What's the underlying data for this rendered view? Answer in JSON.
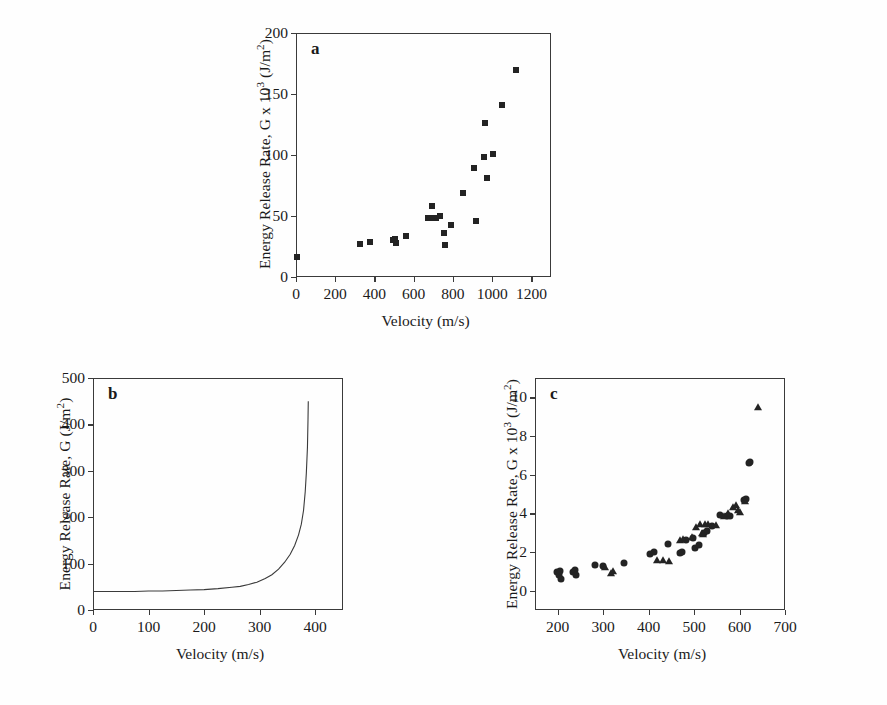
{
  "figure": {
    "background": "#fefefe",
    "ink": "#232323"
  },
  "panels": {
    "a": {
      "letter": "a",
      "xlabel": "Velocity (m/s)",
      "ylabel_parts": {
        "pre": "Energy Release Rate, G x 10",
        "sup": "3",
        "post": " (J/m",
        "sup2": "2",
        "post2": ")"
      },
      "ylabel_text": "Energy Release Rate, G x 10³ (J/m²)"
    },
    "b": {
      "letter": "b",
      "xlabel": "Velocity (m/s)",
      "ylabel_text": "Energy Release Rate, G (J/m²)"
    },
    "c": {
      "letter": "c",
      "xlabel": "Velocity (m/s)",
      "ylabel_text": "Energy Release Rate, G x 10³ (J/m²)"
    }
  },
  "chart_data": [
    {
      "id": "a",
      "type": "scatter",
      "title": "a",
      "xlabel": "Velocity (m/s)",
      "ylabel": "Energy Release Rate, G x 10³ (J/m²)",
      "xlim": [
        0,
        1300
      ],
      "ylim": [
        0,
        200
      ],
      "xticks": [
        0,
        200,
        400,
        600,
        800,
        1000,
        1200
      ],
      "xtick_labels": [
        "0",
        "200",
        "400",
        "600",
        "800",
        "1000",
        "1200"
      ],
      "yticks": [
        0,
        50,
        100,
        150,
        200
      ],
      "ytick_labels": [
        "0",
        "50",
        "100",
        "150",
        "200"
      ],
      "grid": false,
      "legend": "none",
      "series": [
        {
          "name": "Energy release rate",
          "marker": "square",
          "points": [
            [
              5,
              16
            ],
            [
              325,
              27
            ],
            [
              378,
              29
            ],
            [
              495,
              30
            ],
            [
              503,
              31
            ],
            [
              508,
              28
            ],
            [
              560,
              34
            ],
            [
              672,
              48
            ],
            [
              693,
              58
            ],
            [
              700,
              48
            ],
            [
              712,
              48
            ],
            [
              733,
              50
            ],
            [
              757,
              36
            ],
            [
              760,
              26
            ],
            [
              790,
              43
            ],
            [
              852,
              69
            ],
            [
              905,
              89
            ],
            [
              918,
              46
            ],
            [
              958,
              98
            ],
            [
              965,
              126
            ],
            [
              972,
              81
            ],
            [
              1002,
              101
            ],
            [
              1050,
              141
            ],
            [
              1122,
              170
            ]
          ]
        }
      ]
    },
    {
      "id": "b",
      "type": "line",
      "title": "b",
      "xlabel": "Velocity (m/s)",
      "ylabel": "Energy Release Rate, G (J/m²)",
      "xlim": [
        0,
        450
      ],
      "ylim": [
        0,
        500
      ],
      "xticks": [
        0,
        100,
        200,
        300,
        400
      ],
      "xtick_labels": [
        "0",
        "100",
        "200",
        "300",
        "400"
      ],
      "yticks": [
        0,
        100,
        200,
        300,
        400,
        500
      ],
      "ytick_labels": [
        "0",
        "100",
        "200",
        "300",
        "400",
        "500"
      ],
      "grid": false,
      "legend": "none",
      "series": [
        {
          "name": "G(v) asymptotic curve",
          "asymptote_velocity": 387,
          "baseline_G": 40,
          "x": [
            0,
            25,
            50,
            75,
            100,
            125,
            150,
            175,
            200,
            225,
            250,
            265,
            280,
            295,
            310,
            322,
            334,
            345,
            355,
            363,
            370,
            375,
            379,
            382,
            384,
            386,
            387,
            387.5
          ],
          "y": [
            40,
            40,
            40,
            40,
            41,
            41,
            42,
            43,
            44,
            46,
            49,
            51,
            55,
            60,
            68,
            76,
            88,
            103,
            120,
            139,
            162,
            185,
            215,
            255,
            295,
            350,
            410,
            450
          ]
        }
      ]
    },
    {
      "id": "c",
      "type": "scatter",
      "title": "c",
      "xlabel": "Velocity (m/s)",
      "ylabel": "Energy Release Rate, G x 10³ (J/m²)",
      "xlim": [
        150,
        700
      ],
      "ylim": [
        -1,
        11
      ],
      "xticks": [
        200,
        300,
        400,
        500,
        600,
        700
      ],
      "xtick_labels": [
        "200",
        "300",
        "400",
        "500",
        "600",
        "700"
      ],
      "yticks": [
        0,
        2,
        4,
        6,
        8,
        10
      ],
      "ytick_labels": [
        "0",
        "2",
        "4",
        "6",
        "8",
        "10"
      ],
      "grid": false,
      "legend": "none",
      "series": [
        {
          "name": "Circles",
          "marker": "circle",
          "points": [
            [
              198,
              0.95
            ],
            [
              203,
              0.8
            ],
            [
              206,
              1.0
            ],
            [
              207,
              0.62
            ],
            [
              234,
              0.95
            ],
            [
              238,
              1.05
            ],
            [
              240,
              0.82
            ],
            [
              282,
              1.35
            ],
            [
              300,
              1.28
            ],
            [
              345,
              1.45
            ],
            [
              402,
              1.9
            ],
            [
              412,
              2.0
            ],
            [
              443,
              2.4
            ],
            [
              468,
              1.95
            ],
            [
              474,
              2.0
            ],
            [
              482,
              2.6
            ],
            [
              497,
              2.75
            ],
            [
              502,
              2.2
            ],
            [
              510,
              2.35
            ],
            [
              522,
              3.0
            ],
            [
              528,
              3.1
            ],
            [
              540,
              3.35
            ],
            [
              556,
              3.9
            ],
            [
              572,
              3.85
            ],
            [
              578,
              3.85
            ],
            [
              610,
              4.7
            ],
            [
              614,
              4.75
            ],
            [
              620,
              6.6
            ],
            [
              624,
              6.65
            ]
          ]
        },
        {
          "name": "Triangles",
          "marker": "triangle",
          "points": [
            [
              305,
              1.25
            ],
            [
              318,
              0.92
            ],
            [
              322,
              1.0
            ],
            [
              418,
              1.6
            ],
            [
              432,
              1.6
            ],
            [
              444,
              1.55
            ],
            [
              470,
              2.6
            ],
            [
              476,
              2.65
            ],
            [
              495,
              2.8
            ],
            [
              505,
              3.3
            ],
            [
              512,
              3.45
            ],
            [
              518,
              3.0
            ],
            [
              520,
              2.95
            ],
            [
              524,
              3.45
            ],
            [
              530,
              3.45
            ],
            [
              548,
              3.4
            ],
            [
              566,
              3.85
            ],
            [
              574,
              4.0
            ],
            [
              586,
              4.35
            ],
            [
              592,
              4.45
            ],
            [
              596,
              4.15
            ],
            [
              600,
              4.05
            ],
            [
              612,
              4.65
            ],
            [
              641,
              9.5
            ]
          ]
        }
      ]
    }
  ]
}
